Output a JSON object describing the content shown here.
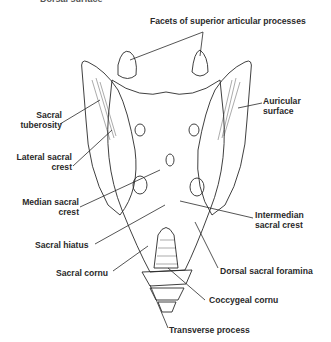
{
  "figure": {
    "clipped_heading": "Dorsal surface",
    "colors": {
      "ink": "#2a2a2a",
      "background": "#ffffff"
    }
  },
  "labels": {
    "facets": "Facets of superior articular processes",
    "sacral_tuberosity_1": "Sacral",
    "sacral_tuberosity_2": "tuberosity",
    "lateral_crest_1": "Lateral sacral",
    "lateral_crest_2": "crest",
    "median_crest_1": "Median sacral",
    "median_crest_2": "crest",
    "sacral_hiatus": "Sacral hiatus",
    "sacral_cornu": "Sacral cornu",
    "auricular_1": "Auricular",
    "auricular_2": "surface",
    "intermedian_1": "Intermedian",
    "intermedian_2": "sacral crest",
    "dorsal_foramina": "Dorsal sacral foramina",
    "coccygeal_cornu": "Coccygeal cornu",
    "transverse_process": "Transverse process"
  }
}
